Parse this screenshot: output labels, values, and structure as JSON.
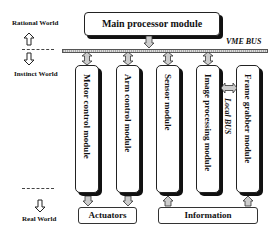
{
  "diagram": {
    "levels": {
      "rational": "Rational World",
      "instinct": "Instinct World",
      "real": "Real World"
    },
    "main_module": "Main processor module",
    "bus_label": "VME BUS",
    "local_bus_label": "Local BUS",
    "modules": [
      {
        "label": "Motor control module"
      },
      {
        "label": "Arm control module"
      },
      {
        "label": "Sensor module"
      },
      {
        "label": "Image processing module"
      },
      {
        "label": "Frame grabber module"
      }
    ],
    "outputs": {
      "actuators": "Actuators",
      "information": "Information"
    },
    "colors": {
      "line": "#222222",
      "shadow": "#111111",
      "hatch": "#aaaaaa"
    }
  }
}
